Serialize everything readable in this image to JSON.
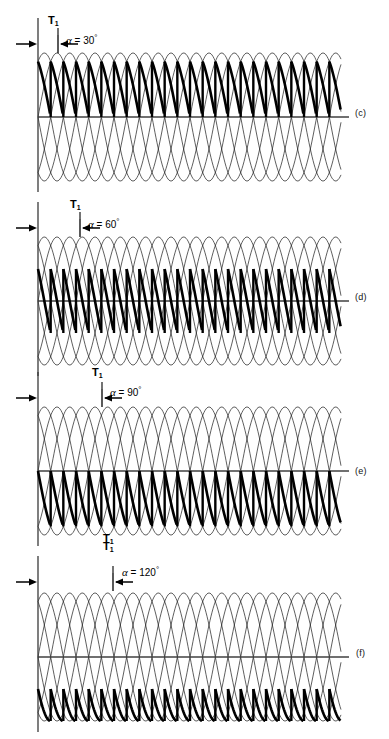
{
  "figure": {
    "background": "#ffffff",
    "width": 389,
    "height": 739,
    "colors": {
      "thin_wave": "#1a1a1a",
      "bold_wave": "#000000",
      "axis": "#404040",
      "text": "#000000"
    }
  },
  "panels": [
    {
      "tag": "(c)",
      "thyristor_label": "T",
      "thyristor_sub": "1",
      "alpha_symbol": "α",
      "alpha_text": " = 30",
      "alpha_degree": "°",
      "alpha_value": 30,
      "tag_x": 355,
      "tag_y": 108,
      "top": 14,
      "height": 180,
      "t1_x": 48,
      "t1_y": 14,
      "alpha_x": 66,
      "alpha_y": 33,
      "mark_x": 58
    },
    {
      "tag": "(d)",
      "thyristor_label": "T",
      "thyristor_sub": "1",
      "alpha_symbol": "α",
      "alpha_text": " = 60",
      "alpha_degree": "°",
      "alpha_value": 60,
      "tag_x": 355,
      "tag_y": 292,
      "top": 198,
      "height": 180,
      "t1_x": 70,
      "t1_y": 198,
      "alpha_x": 88,
      "alpha_y": 217,
      "mark_x": 80
    },
    {
      "tag": "(e)",
      "thyristor_label": "T",
      "thyristor_sub": "1",
      "alpha_symbol": "α",
      "alpha_text": " = 90",
      "alpha_degree": "°",
      "alpha_value": 90,
      "tag_x": 355,
      "tag_y": 466,
      "top": 368,
      "height": 180,
      "t1_x": 92,
      "t1_y": 366,
      "alpha_x": 110,
      "alpha_y": 385,
      "mark_x": 102
    },
    {
      "tag": "(f)",
      "thyristor_label": "T",
      "thyristor_sub": "1",
      "alpha_symbol": "α",
      "alpha_text": " = 120",
      "alpha_degree": "°",
      "alpha_value": 120,
      "tag_x": 356,
      "tag_y": 648,
      "top": 552,
      "height": 182,
      "t1_x": 103,
      "t1_y": 540,
      "alpha_x": 122,
      "alpha_y": 565,
      "mark_x": 113
    }
  ],
  "extra_labels": [
    {
      "text": "T",
      "sub": "1",
      "x": 103,
      "y": 532,
      "note": "lower T1 under panel (e)"
    }
  ],
  "chart_data": {
    "type": "line",
    "xlabel": "",
    "ylabel": "",
    "grid": false,
    "legend": "none",
    "x_range_deg": [
      0,
      1080
    ],
    "ylim": [
      -1.15,
      1.15
    ],
    "phase_count": 6,
    "phase_offsets_deg": [
      0,
      60,
      120,
      180,
      240,
      300
    ],
    "waveform": "sinusoidal half-cycles, six-pulse overlap",
    "panels": [
      {
        "tag": "(c)",
        "alpha_deg": 30,
        "pulses_visible": 9,
        "conduction_highlight": "bold upper arcs with vertical commutation drops"
      },
      {
        "tag": "(d)",
        "alpha_deg": 60,
        "pulses_visible": 9,
        "conduction_highlight": "bold descending arcs reaching zero axis"
      },
      {
        "tag": "(e)",
        "alpha_deg": 90,
        "pulses_visible": 8,
        "conduction_highlight": "bold arcs crossing zero, symmetric about axis"
      },
      {
        "tag": "(f)",
        "alpha_deg": 120,
        "pulses_visible": 8,
        "conduction_highlight": "bold arcs mostly below zero axis"
      }
    ]
  }
}
